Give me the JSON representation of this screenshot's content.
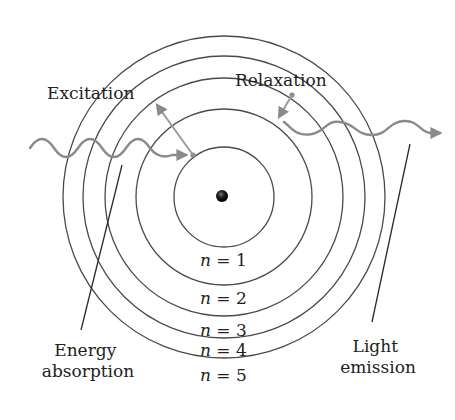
{
  "diagram": {
    "type": "bohr-atom-model",
    "labels": {
      "excitation": "Excitation",
      "relaxation": "Relaxation",
      "energy_absorption_line1": "Energy",
      "energy_absorption_line2": "absorption",
      "light_emission_line1": "Light",
      "light_emission_line2": "emission"
    },
    "levels": [
      {
        "n": "1",
        "label_var": "n",
        "label_eq": " = 1"
      },
      {
        "n": "2",
        "label_var": "n",
        "label_eq": " = 2"
      },
      {
        "n": "3",
        "label_var": "n",
        "label_eq": " = 3"
      },
      {
        "n": "4",
        "label_var": "n",
        "label_eq": " = 4"
      },
      {
        "n": "5",
        "label_var": "n",
        "label_eq": " = 5"
      }
    ],
    "colors": {
      "orbit": "#4a4a4a",
      "photon": "#8a8a8a",
      "nucleus": "#111111",
      "text": "#222222"
    }
  }
}
